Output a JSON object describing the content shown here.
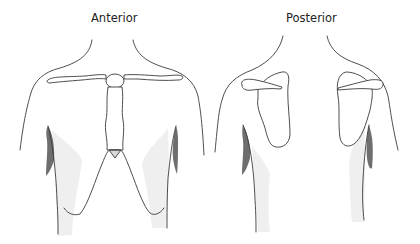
{
  "views": [
    {
      "id": "anterior",
      "label": "Anterior"
    },
    {
      "id": "posterior",
      "label": "Posterior"
    }
  ],
  "colors": {
    "outline": "#3a3a3a",
    "dark_shading": "#6e6e6e",
    "light_shading": "#efefef",
    "background": "#ffffff"
  }
}
